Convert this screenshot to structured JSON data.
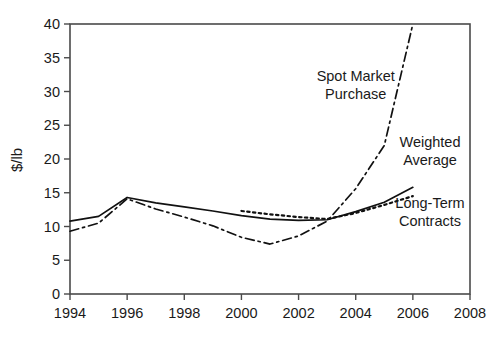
{
  "chart_data": {
    "type": "line",
    "title": "",
    "subtitle": "",
    "xlabel": "",
    "ylabel": "$/lb",
    "xlim": [
      1994,
      2008
    ],
    "ylim": [
      0,
      40
    ],
    "xticks": [
      1994,
      1996,
      1998,
      2000,
      2002,
      2004,
      2006,
      2008
    ],
    "yticks": [
      0,
      5,
      10,
      15,
      20,
      25,
      30,
      35,
      40
    ],
    "xtick_labels": [
      "1994",
      "1996",
      "1998",
      "2000",
      "2002",
      "2004",
      "2006",
      "2008"
    ],
    "ytick_labels": [
      "0",
      "5",
      "10",
      "15",
      "20",
      "25",
      "30",
      "35",
      "40"
    ],
    "grid": false,
    "legend_position": "inline-annotations",
    "series": [
      {
        "name": "Spot Market Purchase",
        "style": "dash-dot",
        "color": "#111111",
        "x": [
          1994,
          1995,
          1996,
          1997,
          1998,
          1999,
          2000,
          2001,
          2002,
          2003,
          2004,
          2005,
          2006
        ],
        "values": [
          9.3,
          10.5,
          14.1,
          12.6,
          11.4,
          10.1,
          8.4,
          7.4,
          8.6,
          10.8,
          15.6,
          22.0,
          40.0
        ]
      },
      {
        "name": "Weighted Average",
        "style": "solid",
        "color": "#111111",
        "x": [
          1994,
          1995,
          1996,
          1997,
          1998,
          1999,
          2000,
          2001,
          2002,
          2003,
          2004,
          2005,
          2006
        ],
        "values": [
          10.8,
          11.5,
          14.3,
          13.5,
          12.9,
          12.3,
          11.6,
          11.1,
          10.9,
          11.0,
          12.2,
          13.6,
          15.8
        ]
      },
      {
        "name": "Long-Term Contracts",
        "style": "dotted",
        "color": "#111111",
        "x": [
          2000,
          2001,
          2002,
          2003,
          2004,
          2005,
          2006
        ],
        "values": [
          12.3,
          11.8,
          11.4,
          11.1,
          12.0,
          13.2,
          14.5
        ]
      }
    ],
    "annotations": [
      {
        "text_line1": "Spot Market",
        "text_line2": "Purchase",
        "x": 2004.0,
        "y": 31.5
      },
      {
        "text_line1": "Weighted",
        "text_line2": "Average",
        "x": 2006.6,
        "y": 21.8
      },
      {
        "text_line1": "Long-Term",
        "text_line2": "Contracts",
        "x": 2006.6,
        "y": 12.8
      }
    ]
  },
  "colors": {
    "line": "#111111",
    "frame": "#4a4a4a",
    "background": "#ffffff",
    "text": "#1a1a1a"
  }
}
